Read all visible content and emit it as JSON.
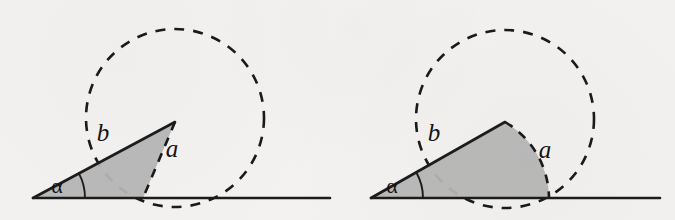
{
  "figure": {
    "background_color": "#f3f2f0",
    "stroke_color": "#1c1c1c",
    "fill_color": "#b3b3b3",
    "dash_color": "#1a1a1a",
    "panels": [
      {
        "id": "left",
        "name": "narrow-triangle-panel",
        "description": "Dashed circle with an inscribed narrow gray triangle resting on the baseline",
        "shape_type": "triangle",
        "circle": {
          "cx": 175,
          "cy": 118,
          "r": 89
        },
        "baseline": {
          "x1": 33,
          "y1": 198,
          "x2": 330,
          "y2": 198
        },
        "vertices": [
          {
            "name": "origin",
            "x": 33,
            "y": 198
          },
          {
            "name": "apex",
            "x": 175,
            "y": 122
          },
          {
            "name": "foot",
            "x": 143,
            "y": 198
          }
        ],
        "angle_arc": {
          "cx": 33,
          "cy": 198,
          "r": 52,
          "from_deg": 0,
          "to_deg": 28
        },
        "labels": {
          "side_a": "a",
          "side_b": "b",
          "angle": "α"
        },
        "label_positions": {
          "side_a": {
            "x": 172,
            "y": 155
          },
          "side_b": {
            "x": 103,
            "y": 141
          },
          "angle": {
            "x": 57,
            "y": 191
          }
        }
      },
      {
        "id": "right",
        "name": "circular-sector-panel",
        "description": "Dashed circle with an inscribed gray circular sector resting on the baseline",
        "shape_type": "sector",
        "circle": {
          "cx": 505,
          "cy": 119,
          "r": 89
        },
        "baseline": {
          "x1": 371,
          "y1": 198,
          "x2": 660,
          "y2": 198
        },
        "vertices": [
          {
            "name": "origin",
            "x": 371,
            "y": 198
          },
          {
            "name": "apex",
            "x": 505,
            "y": 122
          },
          {
            "name": "foot",
            "x": 549,
            "y": 198
          }
        ],
        "angle_arc": {
          "cx": 371,
          "cy": 198,
          "r": 52,
          "from_deg": 0,
          "to_deg": 29
        },
        "labels": {
          "side_a": "a",
          "side_b": "b",
          "angle": "α"
        },
        "label_positions": {
          "side_a": {
            "x": 545,
            "y": 156
          },
          "side_b": {
            "x": 434,
            "y": 141
          },
          "angle": {
            "x": 392,
            "y": 191
          }
        }
      }
    ]
  }
}
